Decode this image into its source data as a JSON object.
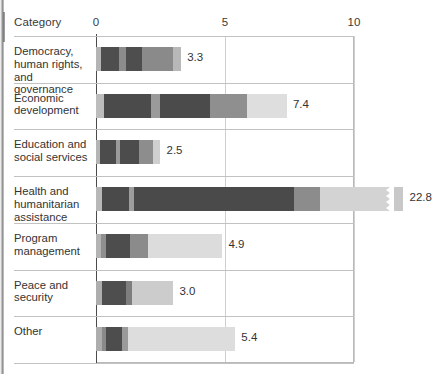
{
  "header": {
    "category_label": "Category",
    "x_ticks": [
      {
        "label": "0",
        "value": 0
      },
      {
        "label": "5",
        "value": 5
      },
      {
        "label": "10",
        "value": 10
      }
    ]
  },
  "chart_data": {
    "type": "bar",
    "orientation": "horizontal",
    "stacked": true,
    "title": "",
    "xlabel": "",
    "ylabel": "Category",
    "xlim": [
      0,
      10
    ],
    "grid": true,
    "legend": "none",
    "axis_break": {
      "present": true,
      "at": 10,
      "note": "Health and humanitarian assistance bar is truncated with a jagged break mark"
    },
    "categories": [
      "Democracy, human rights, and governance",
      "Economic development",
      "Education and social services",
      "Health and humanitarian assistance",
      "Program management",
      "Peace and security",
      "Other"
    ],
    "values": [
      3.3,
      7.4,
      2.5,
      22.8,
      4.9,
      3.0,
      5.4
    ],
    "value_labels": [
      "3.3",
      "7.4",
      "2.5",
      "22.8",
      "4.9",
      "3.0",
      "5.4"
    ],
    "series_colors": [
      "#b0b0b0",
      "#4f4f4f",
      "#7d7d7d",
      "#4f4f4f",
      "#8a8a8a",
      "#d8d8d8",
      "#c9c9c9"
    ],
    "bars": [
      {
        "category": "Democracy, human rights, and governance",
        "total": 3.3,
        "label": "3.3",
        "segments": [
          {
            "width": 0.18,
            "color": "#b4b4b4"
          },
          {
            "width": 0.7,
            "color": "#4e4e4e"
          },
          {
            "width": 0.3,
            "color": "#8c8c8c"
          },
          {
            "width": 0.62,
            "color": "#4e4e4e"
          },
          {
            "width": 1.2,
            "color": "#8a8a8a"
          },
          {
            "width": 0.3,
            "color": "#b8b8b8"
          }
        ]
      },
      {
        "category": "Economic development",
        "total": 7.4,
        "label": "7.4",
        "segments": [
          {
            "width": 0.3,
            "color": "#bdbdbd"
          },
          {
            "width": 1.85,
            "color": "#4b4b4b"
          },
          {
            "width": 0.32,
            "color": "#9a9a9a"
          },
          {
            "width": 1.95,
            "color": "#4b4b4b"
          },
          {
            "width": 1.45,
            "color": "#8f8f8f"
          },
          {
            "width": 1.53,
            "color": "#dedede"
          }
        ]
      },
      {
        "category": "Education and social services",
        "total": 2.5,
        "label": "2.5",
        "segments": [
          {
            "width": 0.15,
            "color": "#b4b4b4"
          },
          {
            "width": 0.62,
            "color": "#4c4c4c"
          },
          {
            "width": 0.16,
            "color": "#9b9b9b"
          },
          {
            "width": 0.72,
            "color": "#4c4c4c"
          },
          {
            "width": 0.55,
            "color": "#8d8d8d"
          },
          {
            "width": 0.3,
            "color": "#cfcfcf"
          }
        ]
      },
      {
        "category": "Health and humanitarian assistance",
        "total": 22.8,
        "label": "22.8",
        "segments": [
          {
            "width": 0.22,
            "color": "#b8b8b8"
          },
          {
            "width": 1.05,
            "color": "#4a4a4a"
          },
          {
            "width": 0.2,
            "color": "#9d9d9d"
          },
          {
            "width": 6.2,
            "color": "#4a4a4a"
          },
          {
            "width": 1.0,
            "color": "#8c8c8c"
          },
          {
            "width": 2.55,
            "color": "#d3d3d3"
          }
        ],
        "overflow_segment": {
          "width": 0.35,
          "color": "#c8c8c8"
        }
      },
      {
        "category": "Program management",
        "total": 4.9,
        "label": "4.9",
        "segments": [
          {
            "width": 0.2,
            "color": "#b4b4b4"
          },
          {
            "width": 0.2,
            "color": "#8f8f8f"
          },
          {
            "width": 0.9,
            "color": "#4d4d4d"
          },
          {
            "width": 0.72,
            "color": "#8b8b8b"
          },
          {
            "width": 2.88,
            "color": "#dcdcdc"
          }
        ]
      },
      {
        "category": "Peace and security",
        "total": 3.0,
        "label": "3.0",
        "segments": [
          {
            "width": 0.22,
            "color": "#aeaeae"
          },
          {
            "width": 0.95,
            "color": "#4e4e4e"
          },
          {
            "width": 0.22,
            "color": "#7e7e7e"
          },
          {
            "width": 1.61,
            "color": "#cccccc"
          }
        ]
      },
      {
        "category": "Other",
        "total": 5.4,
        "label": "5.4",
        "segments": [
          {
            "width": 0.22,
            "color": "#adadad"
          },
          {
            "width": 0.15,
            "color": "#8a8a8a"
          },
          {
            "width": 0.62,
            "color": "#4d4d4d"
          },
          {
            "width": 0.25,
            "color": "#9a9a9a"
          },
          {
            "width": 4.16,
            "color": "#dddddd"
          }
        ]
      }
    ]
  }
}
